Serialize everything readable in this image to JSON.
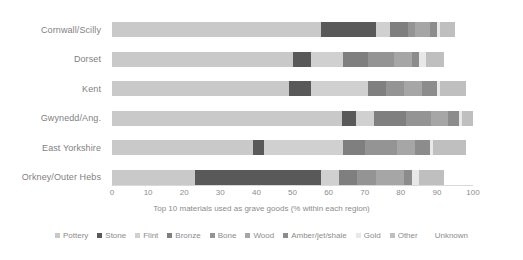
{
  "chart_data": {
    "type": "bar",
    "orientation": "horizontal",
    "stacked": true,
    "title": "",
    "xlabel": "Top 10 materials used as grave goods (% within each region)",
    "ylabel": "",
    "xlim": [
      0,
      100
    ],
    "xticks": [
      0,
      10,
      20,
      30,
      40,
      50,
      60,
      70,
      80,
      90,
      100
    ],
    "grid": false,
    "legend_position": "bottom",
    "categories": [
      "Cornwall/Scilly",
      "Dorset",
      "Kent",
      "Gwynedd/Ang.",
      "East Yorkshire",
      "Orkney/Outer Hebs"
    ],
    "series": [
      {
        "name": "Pottery",
        "color": "#c9c9c9",
        "values": [
          58.0,
          50.0,
          49.0,
          65.0,
          39.0,
          23.0
        ]
      },
      {
        "name": "Stone",
        "color": "#595959",
        "values": [
          15.0,
          5.0,
          6.0,
          4.0,
          3.0,
          35.0
        ]
      },
      {
        "name": "Flint",
        "color": "#d0d0d0",
        "values": [
          4.0,
          9.0,
          16.0,
          5.0,
          22.0,
          5.0
        ]
      },
      {
        "name": "Bronze",
        "color": "#7f7f7f",
        "values": [
          5.0,
          7.0,
          5.0,
          9.0,
          6.0,
          5.0
        ]
      },
      {
        "name": "Bone",
        "color": "#949494",
        "values": [
          2.0,
          7.0,
          5.0,
          7.0,
          9.0,
          5.0
        ]
      },
      {
        "name": "Wood",
        "color": "#a6a6a6",
        "values": [
          4.0,
          5.0,
          5.0,
          5.0,
          5.0,
          8.0
        ]
      },
      {
        "name": "Amber/jet/shale",
        "color": "#8c8c8c",
        "values": [
          2.0,
          2.0,
          4.0,
          3.0,
          4.0,
          2.0
        ]
      },
      {
        "name": "Gold",
        "color": "#e8e8e8",
        "values": [
          1.0,
          2.0,
          1.0,
          1.0,
          1.0,
          2.0
        ]
      },
      {
        "name": "Other",
        "color": "#bfbfbf",
        "values": [
          4.0,
          5.0,
          7.0,
          3.0,
          9.0,
          7.0
        ]
      },
      {
        "name": "Unknown",
        "color": "#ffffff",
        "values": [
          5.0,
          8.0,
          2.0,
          0.0,
          2.0,
          8.0
        ]
      }
    ]
  },
  "axis": {
    "tick_labels": [
      "0",
      "10",
      "20",
      "30",
      "40",
      "50",
      "60",
      "70",
      "80",
      "90",
      "100"
    ],
    "x_axis_title": "Top 10 materials used as grave goods (% within each region)"
  },
  "legend": {
    "items": [
      {
        "label": "Pottery",
        "color": "#c9c9c9",
        "swatch": true
      },
      {
        "label": "Stone",
        "color": "#595959",
        "swatch": true
      },
      {
        "label": "Flint",
        "color": "#d0d0d0",
        "swatch": true
      },
      {
        "label": "Bronze",
        "color": "#7f7f7f",
        "swatch": true
      },
      {
        "label": "Bone",
        "color": "#949494",
        "swatch": true
      },
      {
        "label": "Wood",
        "color": "#a6a6a6",
        "swatch": true
      },
      {
        "label": "Amber/jet/shale",
        "color": "#8c8c8c",
        "swatch": true
      },
      {
        "label": "Gold",
        "color": "#e8e8e8",
        "swatch": true
      },
      {
        "label": "Other",
        "color": "#bfbfbf",
        "swatch": true
      },
      {
        "label": "Unknown",
        "color": "#ffffff",
        "swatch": false
      }
    ]
  }
}
